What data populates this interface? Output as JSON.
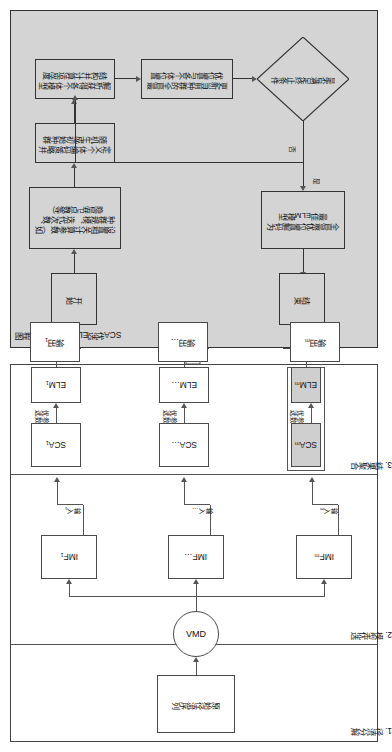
{
  "figure": {
    "type": "flowchart-diagram",
    "orientation": "rotated-90-ccw",
    "left_panel": {
      "sections": [
        {
          "id": "s1",
          "label": "1. 径流分解"
        },
        {
          "id": "s2",
          "label": "2. 模型优选"
        },
        {
          "id": "s3",
          "label": "3. 结果聚合"
        }
      ],
      "nodes": {
        "source": "原始径流序列",
        "decomposer": "VMD",
        "imf": [
          "IMF₁",
          "IMF…",
          "IMFₘ"
        ],
        "sca": [
          "SCA₁",
          "SCA…",
          "SCAₘ"
        ],
        "elm": [
          "ELM₁",
          "ELM…",
          "ELMₘ"
        ],
        "output": [
          "输出₁",
          "输出…",
          "输出ₘ"
        ],
        "aggregator": "Σ",
        "final": "最终预报结果"
      },
      "edge_labels": {
        "input": [
          "输入₁",
          "输入…",
          "输入ₘ"
        ],
        "param_opt": [
          "参数\n优选",
          "参数\n优选",
          "参数\n优选"
        ],
        "param_opt_line1": "参数",
        "param_opt_line2": "优选"
      },
      "highlight_color": "#cfcfcf"
    },
    "right_panel": {
      "title": "SCA优选ELM模型参数流程图",
      "background": "#d4d4d4",
      "nodes": [
        {
          "id": "start",
          "label": "开始",
          "shape": "rect"
        },
        {
          "id": "params",
          "label": "设置相关计算参数（如种群规模、迭代次数、隐层节点数等）",
          "shape": "rect"
        },
        {
          "id": "init",
          "label": "定义个体编码策略并随机生成初始种群",
          "shape": "rect"
        },
        {
          "id": "fitness",
          "label": "解析获得各个体模型结构并计算适应度",
          "shape": "rect"
        },
        {
          "id": "update",
          "label": "更新当前种群的全局最优位置与各个体位置",
          "shape": "rect"
        },
        {
          "id": "check",
          "label": "是否满足终止条件",
          "shape": "diamond"
        },
        {
          "id": "decode",
          "label": "全局最优位置解码为最佳ELM模型",
          "shape": "rect"
        },
        {
          "id": "end",
          "label": "结束",
          "shape": "rect"
        }
      ],
      "branch_labels": {
        "no": "否",
        "yes": "是"
      }
    }
  }
}
